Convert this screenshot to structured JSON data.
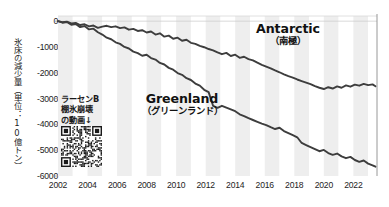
{
  "chart_data": {
    "type": "line",
    "title": "",
    "xlabel": "",
    "ylabel": "氷床の減少量（単位：10億トン）",
    "xlim": [
      2002.0,
      2023.6
    ],
    "ylim": [
      -6000,
      200
    ],
    "grid": false,
    "legend_position": "inline-annotations",
    "xticks": [
      "2002",
      "2004",
      "2006",
      "2008",
      "2010",
      "2012",
      "2014",
      "2016",
      "2018",
      "2020",
      "2022"
    ],
    "xtick_values": [
      2002,
      2004,
      2006,
      2008,
      2010,
      2012,
      2014,
      2016,
      2018,
      2020,
      2022
    ],
    "yticks": [
      "0",
      "-1000",
      "-2000",
      "-3000",
      "-4000",
      "-5000",
      "-6000"
    ],
    "ytick_values": [
      0,
      -1000,
      -2000,
      -3000,
      -4000,
      -5000,
      -6000
    ],
    "series": [
      {
        "name": "Antarctic",
        "name_jp": "（南極）",
        "color": "#3d3d3d",
        "x": [
          2002.0,
          2002.3,
          2002.6,
          2002.9,
          2003.2,
          2003.5,
          2003.8,
          2004.1,
          2004.4,
          2004.7,
          2005.0,
          2005.3,
          2005.6,
          2005.9,
          2006.2,
          2006.5,
          2006.8,
          2007.1,
          2007.4,
          2007.7,
          2008.0,
          2008.3,
          2008.6,
          2008.9,
          2009.2,
          2009.5,
          2009.8,
          2010.1,
          2010.4,
          2010.7,
          2011.0,
          2011.3,
          2011.6,
          2011.9,
          2012.2,
          2012.5,
          2012.8,
          2013.1,
          2013.4,
          2013.7,
          2014.0,
          2014.3,
          2014.6,
          2014.9,
          2015.2,
          2015.5,
          2015.8,
          2016.1,
          2016.4,
          2016.7,
          2017.0,
          2017.3,
          2017.6,
          2017.9,
          2018.2,
          2018.5,
          2018.8,
          2019.1,
          2019.4,
          2019.7,
          2020.0,
          2020.3,
          2020.6,
          2020.9,
          2021.2,
          2021.5,
          2021.8,
          2022.1,
          2022.4,
          2022.7,
          2023.0,
          2023.3,
          2023.5
        ],
        "y": [
          0,
          -40,
          -20,
          -90,
          -70,
          -150,
          -120,
          -200,
          -170,
          -260,
          -210,
          -180,
          -230,
          -200,
          -270,
          -240,
          -330,
          -300,
          -380,
          -350,
          -440,
          -400,
          -520,
          -470,
          -600,
          -560,
          -680,
          -640,
          -760,
          -720,
          -840,
          -880,
          -960,
          -1010,
          -1080,
          -1130,
          -1210,
          -1280,
          -1230,
          -1350,
          -1300,
          -1420,
          -1380,
          -1470,
          -1520,
          -1610,
          -1690,
          -1760,
          -1830,
          -1910,
          -1980,
          -2060,
          -2130,
          -2190,
          -2260,
          -2320,
          -2380,
          -2440,
          -2520,
          -2580,
          -2630,
          -2560,
          -2610,
          -2530,
          -2580,
          -2490,
          -2540,
          -2460,
          -2500,
          -2430,
          -2480,
          -2450,
          -2520
        ]
      },
      {
        "name": "Greenland",
        "name_jp": "（グリーンランド）",
        "color": "#3d3d3d",
        "x": [
          2002.0,
          2002.3,
          2002.6,
          2002.9,
          2003.2,
          2003.5,
          2003.8,
          2004.1,
          2004.4,
          2004.7,
          2005.0,
          2005.3,
          2005.6,
          2005.9,
          2006.2,
          2006.5,
          2006.8,
          2007.1,
          2007.4,
          2007.7,
          2008.0,
          2008.3,
          2008.6,
          2008.9,
          2009.2,
          2009.5,
          2009.8,
          2010.1,
          2010.4,
          2010.7,
          2011.0,
          2011.3,
          2011.6,
          2011.9,
          2012.2,
          2012.5,
          2012.8,
          2013.1,
          2013.4,
          2013.7,
          2014.0,
          2014.3,
          2014.6,
          2014.9,
          2015.2,
          2015.5,
          2015.8,
          2016.1,
          2016.4,
          2016.7,
          2017.0,
          2017.3,
          2017.6,
          2017.9,
          2018.2,
          2018.5,
          2018.8,
          2019.1,
          2019.4,
          2019.7,
          2020.0,
          2020.3,
          2020.6,
          2020.9,
          2021.2,
          2021.5,
          2021.8,
          2022.1,
          2022.4,
          2022.7,
          2023.0,
          2023.3,
          2023.5
        ],
        "y": [
          0,
          -60,
          -30,
          -140,
          -110,
          -230,
          -190,
          -320,
          -290,
          -430,
          -520,
          -640,
          -700,
          -820,
          -880,
          -1000,
          -1060,
          -1180,
          -1240,
          -1340,
          -1300,
          -1430,
          -1490,
          -1620,
          -1680,
          -1810,
          -1880,
          -2010,
          -2080,
          -2210,
          -2280,
          -2420,
          -2500,
          -2660,
          -2750,
          -3280,
          -3360,
          -3280,
          -3350,
          -3420,
          -3490,
          -3610,
          -3680,
          -3760,
          -3830,
          -3900,
          -3970,
          -4030,
          -4110,
          -4180,
          -4130,
          -4260,
          -4340,
          -4420,
          -4500,
          -4720,
          -4800,
          -4880,
          -4960,
          -5040,
          -4990,
          -5110,
          -5180,
          -5130,
          -5240,
          -5310,
          -5260,
          -5380,
          -5450,
          -5400,
          -5520,
          -5590,
          -5640
        ]
      }
    ],
    "annotations": [
      {
        "name": "larsen-b-note",
        "lines": [
          "ラーセンB",
          "棚氷崩壊",
          "の動画↓"
        ],
        "has_qr_code": true
      }
    ],
    "plot_background": {
      "band_color_light": "#ffffff",
      "band_color_shade": "#eeeeee",
      "band_interval_years": 1
    },
    "right_marker_line": true
  }
}
